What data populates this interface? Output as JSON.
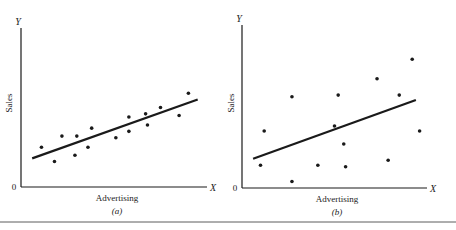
{
  "chart_data": [
    {
      "type": "scatter",
      "panel": "(a)",
      "title": "",
      "xlabel": "Advertising",
      "ylabel": "Sales",
      "x_axis_letter": "X",
      "y_axis_letter": "Y",
      "origin_label": "0",
      "caption": "(a)",
      "grid": false,
      "legend": null,
      "fit_line": {
        "x0": 0.06,
        "y0": 0.18,
        "x1": 0.95,
        "y1": 0.55
      },
      "points": [
        {
          "x": 0.11,
          "y": 0.25
        },
        {
          "x": 0.18,
          "y": 0.16
        },
        {
          "x": 0.22,
          "y": 0.32
        },
        {
          "x": 0.29,
          "y": 0.2
        },
        {
          "x": 0.3,
          "y": 0.32
        },
        {
          "x": 0.36,
          "y": 0.25
        },
        {
          "x": 0.38,
          "y": 0.37
        },
        {
          "x": 0.51,
          "y": 0.31
        },
        {
          "x": 0.58,
          "y": 0.44
        },
        {
          "x": 0.58,
          "y": 0.35
        },
        {
          "x": 0.67,
          "y": 0.46
        },
        {
          "x": 0.68,
          "y": 0.39
        },
        {
          "x": 0.75,
          "y": 0.5
        },
        {
          "x": 0.85,
          "y": 0.45
        },
        {
          "x": 0.9,
          "y": 0.59
        }
      ],
      "note": "Tight positive linear relationship; axes unscaled (no tick values)"
    },
    {
      "type": "scatter",
      "panel": "(b)",
      "title": "",
      "xlabel": "Advertising",
      "ylabel": "Sales",
      "x_axis_letter": "X",
      "y_axis_letter": "Y",
      "origin_label": "0",
      "caption": "(b)",
      "grid": false,
      "legend": null,
      "fit_line": {
        "x0": 0.06,
        "y0": 0.18,
        "x1": 0.94,
        "y1": 0.54
      },
      "points": [
        {
          "x": 0.12,
          "y": 0.35
        },
        {
          "x": 0.1,
          "y": 0.14
        },
        {
          "x": 0.27,
          "y": 0.56
        },
        {
          "x": 0.27,
          "y": 0.04
        },
        {
          "x": 0.41,
          "y": 0.14
        },
        {
          "x": 0.5,
          "y": 0.38
        },
        {
          "x": 0.52,
          "y": 0.57
        },
        {
          "x": 0.55,
          "y": 0.27
        },
        {
          "x": 0.56,
          "y": 0.13
        },
        {
          "x": 0.73,
          "y": 0.67
        },
        {
          "x": 0.79,
          "y": 0.17
        },
        {
          "x": 0.85,
          "y": 0.57
        },
        {
          "x": 0.92,
          "y": 0.79
        },
        {
          "x": 0.96,
          "y": 0.35
        }
      ],
      "note": "Weak positive relationship with wide scatter; axes unscaled (no tick values)"
    }
  ],
  "colors": {
    "ink": "#1a1a1a",
    "background": "#ffffff"
  }
}
